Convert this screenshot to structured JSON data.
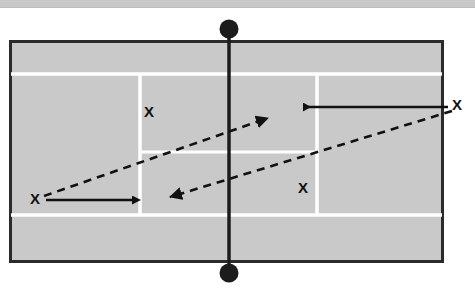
{
  "diagram": {
    "type": "tennis-court-tactics",
    "surface_color": "#c9c9c9",
    "line_color": "#ffffff",
    "border_color": "#2b2b2b",
    "ink_color": "#111111",
    "top_band_color": "#c8c8c8",
    "background_color": "#ffffff"
  },
  "court": {
    "label": "tennis-court",
    "outer": {
      "x": 10,
      "y": 41,
      "width": 433,
      "height": 221
    },
    "lines": {
      "top_doubles_sideline_y": 74,
      "bottom_doubles_sideline_y": 215,
      "left_singles_line_x": 140,
      "right_singles_line_x": 317,
      "center_service_line_y": 152
    },
    "net": {
      "label": "net",
      "x": 229,
      "top_post_y": 29,
      "bottom_post_y": 273,
      "post_radius": 9
    }
  },
  "players": [
    {
      "id": "player-left",
      "label": "X",
      "x": 35,
      "y": 200,
      "position": "left-baseline-deuce-side"
    },
    {
      "id": "player-right",
      "label": "X",
      "x": 457,
      "y": 106,
      "position": "right-baseline-ad-side"
    },
    {
      "id": "target-upper-left",
      "label": "X",
      "x": 149,
      "y": 113,
      "position": "upper-left-service-box"
    },
    {
      "id": "target-lower-right",
      "label": "X",
      "x": 303,
      "y": 189,
      "position": "lower-right-service-box"
    }
  ],
  "movement_arrows": [
    {
      "id": "movement-left-player",
      "style": "solid",
      "from": {
        "x": 46,
        "y": 200
      },
      "to": {
        "x": 133,
        "y": 200
      },
      "direction": "right"
    },
    {
      "id": "movement-right-player",
      "style": "solid",
      "from": {
        "x": 448,
        "y": 107
      },
      "to": {
        "x": 303,
        "y": 107
      },
      "direction": "left"
    }
  ],
  "ball_paths": [
    {
      "id": "ball-path-outgoing",
      "style": "dashed",
      "from": {
        "x": 44,
        "y": 196
      },
      "to": {
        "x": 276,
        "y": 115
      },
      "direction": "up-right"
    },
    {
      "id": "ball-path-incoming",
      "style": "dashed",
      "from": {
        "x": 452,
        "y": 111
      },
      "to": {
        "x": 159,
        "y": 200
      },
      "direction": "down-left"
    }
  ]
}
